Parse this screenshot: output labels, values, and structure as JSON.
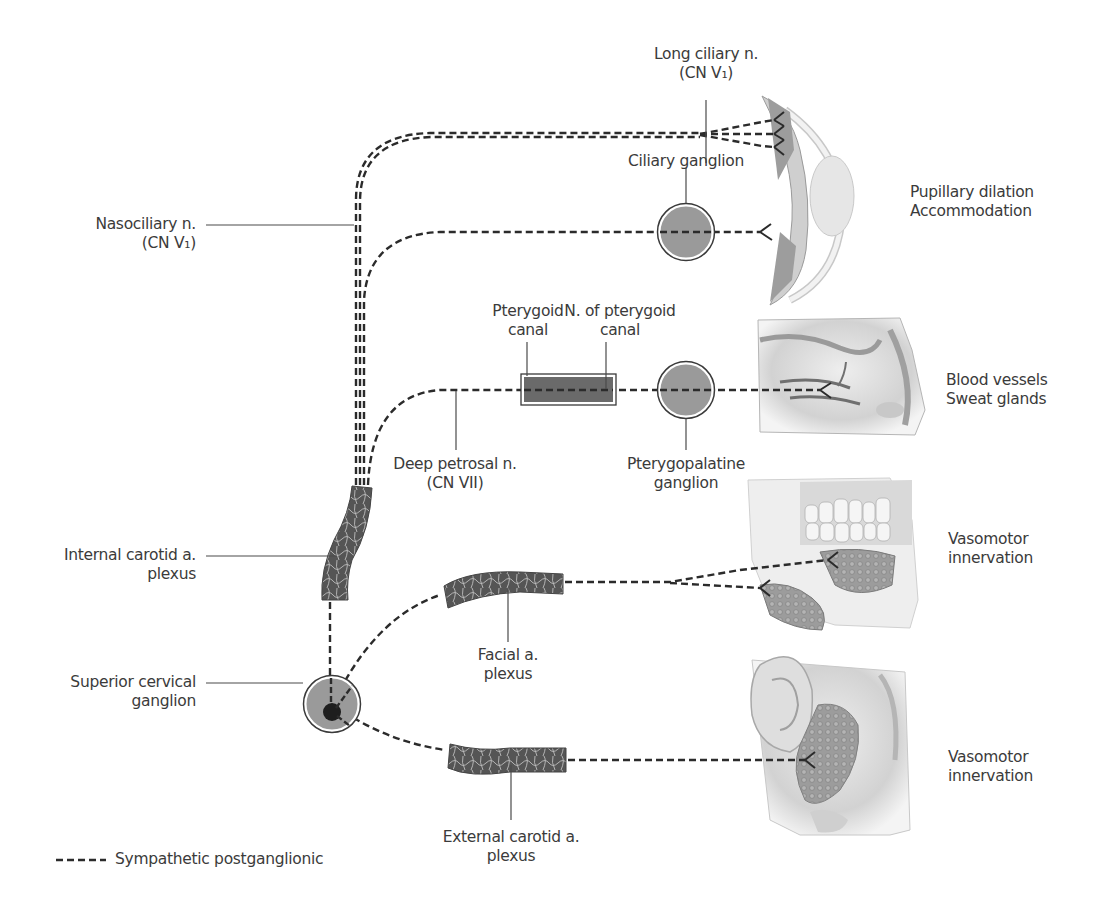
{
  "colors": {
    "nerve_dash": "#2b2b2b",
    "ganglion_fill": "#9a9a9a",
    "ganglion_ring": "#3a3a3a",
    "canal_fill": "#6a6a6a",
    "plexus_fill": "#5a5a5a",
    "label_text": "#3b3b3b",
    "leader_line": "#4a4a4a",
    "tissue_gray": "#d6d6d6"
  },
  "labels": {
    "long_ciliary": {
      "line1": "Long ciliary n.",
      "line2": "(CN V₁)"
    },
    "nasociliary": {
      "line1": "Nasociliary n.",
      "line2": "(CN V₁)"
    },
    "ciliary_ganglion": {
      "line1": "Ciliary ganglion"
    },
    "pupil_target": {
      "line1": "Pupillary dilation",
      "line2": "Accommodation"
    },
    "pterygoid_canal": {
      "line1": "Pterygoid",
      "line2": "canal"
    },
    "n_pterygoid_canal": {
      "line1": "N. of pterygoid",
      "line2": "canal"
    },
    "nasal_target": {
      "line1": "Blood vessels",
      "line2": "Sweat glands"
    },
    "deep_petrosal": {
      "line1": "Deep petrosal n.",
      "line2": "(CN VII)"
    },
    "pterygopalatine": {
      "line1": "Pterygopalatine",
      "line2": "ganglion"
    },
    "internal_carotid": {
      "line1": "Internal carotid a.",
      "line2": "plexus"
    },
    "facial_plexus": {
      "line1": "Facial a.",
      "line2": "plexus"
    },
    "jaw_target": {
      "line1": "Vasomotor",
      "line2": "innervation"
    },
    "superior_cervical": {
      "line1": "Superior cervical",
      "line2": "ganglion"
    },
    "external_carotid": {
      "line1": "External carotid a.",
      "line2": "plexus"
    },
    "parotid_target": {
      "line1": "Vasomotor",
      "line2": "innervation"
    }
  },
  "legend": {
    "symbol": "-----",
    "label": "Sympathetic postganglionic"
  },
  "illustrations": {
    "eye": "eye-cross-section",
    "nasal": "nasal-cavity-lateral-wall",
    "jaw": "mandible-with-salivary-glands",
    "parotid": "ear-and-parotid-gland"
  }
}
